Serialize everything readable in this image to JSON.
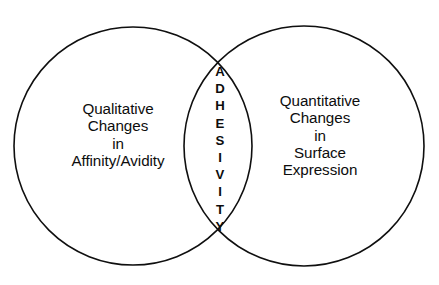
{
  "figure": {
    "type": "venn-diagram",
    "background_color": "#ffffff",
    "stroke_color": "#0f0f0f",
    "text_color": "#0d0d0d",
    "left_set": {
      "name": "qualitative-changes",
      "lines": [
        "Qualitative",
        "Changes",
        "in",
        "Affinity/Avidity"
      ]
    },
    "right_set": {
      "name": "quantitative-changes",
      "lines": [
        "Quantitative",
        "Changes",
        "in",
        "Surface",
        "Expression"
      ]
    },
    "intersection": {
      "name": "adhesivity",
      "text": "ADHESIVITY",
      "orientation": "vertical",
      "letters": [
        "A",
        "D",
        "H",
        "E",
        "S",
        "I",
        "V",
        "I",
        "T",
        "Y"
      ]
    },
    "geometry": {
      "left_circle": {
        "cx": 133,
        "cy": 146,
        "r": 119
      },
      "right_circle": {
        "cx": 304,
        "cy": 146,
        "r": 120
      }
    }
  }
}
